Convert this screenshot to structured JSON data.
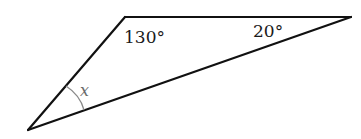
{
  "figure": {
    "type": "triangle",
    "vertices": {
      "top_left": [
        125,
        17
      ],
      "top_right": [
        351,
        17
      ],
      "bottom_left": [
        28,
        130
      ]
    },
    "angle_labels": {
      "top_left": "130°",
      "top_right": "20°",
      "bottom_left": "x"
    },
    "colors": {
      "line": "#111111",
      "arc": "#8a8a8a",
      "text": "#1a1a1a",
      "unknown_text": "#6b6b6b",
      "background": "#ffffff"
    }
  }
}
